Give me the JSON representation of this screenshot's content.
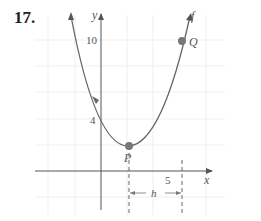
{
  "problem": {
    "number": "17."
  },
  "graph": {
    "function_label": "f",
    "x_axis_label": "x",
    "y_axis_label": "y",
    "y_tick_label": "10",
    "y_intercept_label": "4",
    "x_tick_label": "5",
    "point_P_label": "P",
    "point_Q_label": "Q",
    "interval_label": "h",
    "colors": {
      "curve": "#666666",
      "axis": "#555555",
      "point": "#777777",
      "grid": "#eeeeee"
    }
  }
}
